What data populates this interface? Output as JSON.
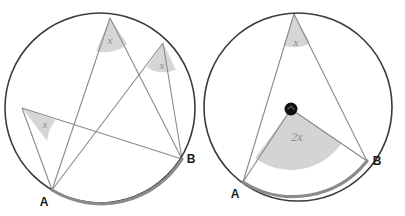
{
  "figure": {
    "background_color": "#ffffff",
    "circle_stroke": "#3b3b3b",
    "chord_stroke": "#8a8a8a",
    "arc_highlight_color": "#8a8a8a",
    "wedge_fill": "#cfcfcf",
    "center_dot_color": "#111111",
    "label_color": "#1a1a1a",
    "angle_label_color": "#8c8c8c"
  },
  "panels": [
    {
      "id": "left",
      "name": "inscribed-angles-circle",
      "circle": {
        "cx": 100,
        "cy": 108,
        "r": 95
      },
      "points": {
        "A": {
          "x": 52,
          "y": 190,
          "label": "A"
        },
        "B": {
          "x": 182,
          "y": 159,
          "label": "B"
        },
        "V1": {
          "x": 110,
          "y": 18
        },
        "V2": {
          "x": 163,
          "y": 43
        },
        "V3": {
          "x": 22,
          "y": 108
        }
      },
      "highlight_arc": {
        "from": "A",
        "to": "B",
        "side": "minor"
      },
      "angles": [
        {
          "vertex": "V1",
          "label": "x",
          "lx": 110,
          "ly": 44
        },
        {
          "vertex": "V2",
          "label": "x",
          "lx": 162,
          "ly": 69
        },
        {
          "vertex": "V3",
          "label": "x",
          "lx": 45,
          "ly": 128
        }
      ]
    },
    {
      "id": "right",
      "name": "central-angle-circle",
      "circle": {
        "cx": 298,
        "cy": 107,
        "r": 94
      },
      "points": {
        "A": {
          "x": 243,
          "y": 182,
          "label": "A"
        },
        "B": {
          "x": 367,
          "y": 161,
          "label": "B"
        },
        "V1": {
          "x": 294,
          "y": 14
        },
        "O": {
          "x": 291,
          "y": 109
        }
      },
      "highlight_arc": {
        "from": "A",
        "to": "B",
        "side": "minor"
      },
      "center_marked": true,
      "angles": [
        {
          "vertex": "V1",
          "label": "x",
          "lx": 296,
          "ly": 46
        },
        {
          "vertex": "O",
          "label": "2x",
          "lx": 297,
          "ly": 141
        }
      ]
    }
  ]
}
